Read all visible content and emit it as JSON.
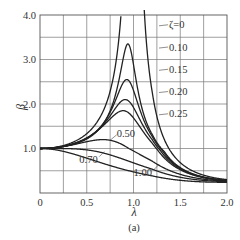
{
  "chart_data": {
    "type": "line",
    "title": "",
    "caption": "(a)",
    "xlabel": "λ",
    "ylabel": "β",
    "xlim": [
      0,
      2.0
    ],
    "ylim": [
      0,
      4.0
    ],
    "grid": true,
    "x_ticks": [
      {
        "value": 0,
        "label": "0"
      },
      {
        "value": 0.5,
        "label": "0.5"
      },
      {
        "value": 1.0,
        "label": "1.0"
      },
      {
        "value": 1.5,
        "label": "1.5"
      },
      {
        "value": 2.0,
        "label": "2.0"
      }
    ],
    "y_ticks": [
      {
        "value": 1.0,
        "label": "1.0"
      },
      {
        "value": 2.0,
        "label": "2.0"
      },
      {
        "value": 3.0,
        "label": "3.0"
      },
      {
        "value": 4.0,
        "label": "4.0"
      }
    ],
    "series": [
      {
        "name": "ζ=0",
        "zeta": 0.0,
        "peak_beta": "∞",
        "peak_lambda": 1.0
      },
      {
        "name": "0.10",
        "zeta": 0.1,
        "peak_beta": 3.35,
        "peak_lambda": 0.95
      },
      {
        "name": "0.15",
        "zeta": 0.15,
        "peak_beta": 2.55,
        "peak_lambda": 0.95
      },
      {
        "name": "0.20",
        "zeta": 0.2,
        "peak_beta": 2.1,
        "peak_lambda": 0.94
      },
      {
        "name": "0.25",
        "zeta": 0.25,
        "peak_beta": 1.85,
        "peak_lambda": 0.92
      },
      {
        "name": "0.50",
        "zeta": 0.5,
        "peak_beta": 1.2,
        "peak_lambda": 0.75
      },
      {
        "name": "0.70",
        "zeta": 0.7,
        "peak_beta": 1.0,
        "peak_lambda": 0.0
      },
      {
        "name": "1.00",
        "zeta": 1.0,
        "peak_beta": 1.0,
        "peak_lambda": 0.0
      }
    ],
    "curve_labels": [
      {
        "text": "ζ=0",
        "x": 1.38,
        "y": 3.78
      },
      {
        "text": "0.10",
        "x": 1.38,
        "y": 3.28
      },
      {
        "text": "0.15",
        "x": 1.38,
        "y": 2.78
      },
      {
        "text": "0.20",
        "x": 1.38,
        "y": 2.28
      },
      {
        "text": "0.25",
        "x": 1.38,
        "y": 1.78
      },
      {
        "text": "0.50",
        "x": 0.82,
        "y": 1.33
      },
      {
        "text": "0.70",
        "x": 0.42,
        "y": 0.75
      },
      {
        "text": "1.00",
        "x": 1.0,
        "y": 0.45
      }
    ],
    "convergence_point": {
      "lambda": 2.0,
      "beta": 0.28
    }
  }
}
